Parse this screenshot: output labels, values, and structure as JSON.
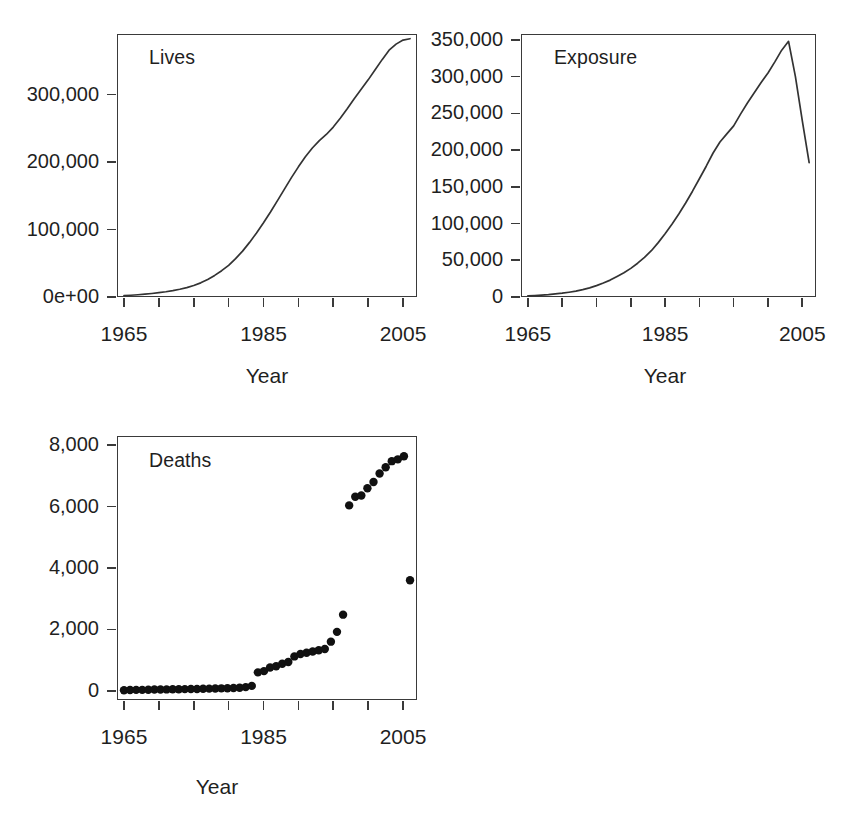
{
  "figure": {
    "background_color": "#ffffff",
    "line_color": "#333333",
    "point_color": "#111111",
    "axis_color": "#3a3a3a"
  },
  "panels": [
    {
      "id": "lives",
      "label": "Lives",
      "xlabel": "Year",
      "ylabel": "",
      "x_ticks": [
        1965,
        1970,
        1975,
        1980,
        1985,
        1990,
        1995,
        2000,
        2005
      ],
      "x_tick_labels": [
        "1965",
        "",
        "1985",
        "",
        "2005"
      ],
      "x_labeled_ticks": [
        1965,
        1985,
        2005
      ],
      "y_ticks": [
        0,
        100000,
        200000,
        300000
      ],
      "y_tick_labels": [
        "0e+00",
        "100,000",
        "200,000",
        "300,000"
      ],
      "xlim": [
        1964,
        2007
      ],
      "ylim": [
        0,
        390000
      ]
    },
    {
      "id": "exposure",
      "label": "Exposure",
      "xlabel": "Year",
      "ylabel": "",
      "x_ticks": [
        1965,
        1970,
        1975,
        1980,
        1985,
        1990,
        1995,
        2000,
        2005
      ],
      "x_tick_labels": [
        "1965",
        "",
        "1985",
        "",
        "2005"
      ],
      "x_labeled_ticks": [
        1965,
        1985,
        2005
      ],
      "y_ticks": [
        0,
        50000,
        100000,
        150000,
        200000,
        250000,
        300000,
        350000
      ],
      "y_tick_labels": [
        "0",
        "50,000",
        "100,000",
        "150,000",
        "200,000",
        "250,000",
        "300,000",
        "350,000"
      ],
      "xlim": [
        1964,
        2007
      ],
      "ylim": [
        0,
        358000
      ]
    },
    {
      "id": "deaths",
      "label": "Deaths",
      "xlabel": "Year",
      "ylabel": "",
      "x_ticks": [
        1965,
        1970,
        1975,
        1980,
        1985,
        1990,
        1995,
        2000,
        2005
      ],
      "x_tick_labels": [
        "1965",
        "",
        "1985",
        "",
        "2005"
      ],
      "x_labeled_ticks": [
        1965,
        1985,
        2005
      ],
      "y_ticks": [
        0,
        2000,
        4000,
        6000,
        8000
      ],
      "y_tick_labels": [
        "0",
        "2,000",
        "4,000",
        "6,000",
        "8,000"
      ],
      "xlim": [
        1964,
        2007
      ],
      "ylim": [
        -300,
        8300
      ]
    }
  ],
  "chart_data": [
    {
      "type": "line",
      "title": "Lives",
      "xlabel": "Year",
      "ylabel": "",
      "grid": false,
      "legend": "none",
      "xlim": [
        1964,
        2007
      ],
      "ylim": [
        0,
        390000
      ],
      "x": [
        1965,
        1966,
        1967,
        1968,
        1969,
        1970,
        1971,
        1972,
        1973,
        1974,
        1975,
        1976,
        1977,
        1978,
        1979,
        1980,
        1981,
        1982,
        1983,
        1984,
        1985,
        1986,
        1987,
        1988,
        1989,
        1990,
        1991,
        1992,
        1993,
        1994,
        1995,
        1996,
        1997,
        1998,
        1999,
        2000,
        2001,
        2002,
        2003,
        2004,
        2005,
        2006
      ],
      "values": [
        2000,
        2600,
        3300,
        4200,
        5200,
        6400,
        7800,
        9500,
        11500,
        14000,
        17000,
        21000,
        26000,
        32000,
        39000,
        47000,
        57000,
        68000,
        81000,
        95000,
        110000,
        126000,
        143000,
        160000,
        177000,
        193000,
        208000,
        221000,
        232000,
        241000,
        252000,
        265000,
        279000,
        294000,
        308000,
        322000,
        337000,
        352000,
        366000,
        375000,
        381000,
        383000
      ]
    },
    {
      "type": "line",
      "title": "Exposure",
      "xlabel": "Year",
      "ylabel": "",
      "grid": false,
      "legend": "none",
      "xlim": [
        1964,
        2007
      ],
      "ylim": [
        0,
        358000
      ],
      "x": [
        1965,
        1966,
        1967,
        1968,
        1969,
        1970,
        1971,
        1972,
        1973,
        1974,
        1975,
        1976,
        1977,
        1978,
        1979,
        1980,
        1981,
        1982,
        1983,
        1984,
        1985,
        1986,
        1987,
        1988,
        1989,
        1990,
        1991,
        1992,
        1993,
        1994,
        1995,
        1996,
        1997,
        1998,
        1999,
        2000,
        2001,
        2002,
        2003,
        2004,
        2005,
        2006
      ],
      "values": [
        1500,
        2000,
        2600,
        3300,
        4200,
        5200,
        6500,
        8000,
        10000,
        12500,
        15500,
        19000,
        23000,
        28000,
        33000,
        39000,
        46000,
        54000,
        63000,
        74000,
        86000,
        99000,
        113000,
        128000,
        144000,
        161000,
        178000,
        196000,
        211000,
        222000,
        233000,
        249000,
        264000,
        278000,
        292000,
        305000,
        320000,
        336000,
        348000,
        300000,
        240000,
        183000
      ]
    },
    {
      "type": "scatter",
      "title": "Deaths",
      "xlabel": "Year",
      "ylabel": "",
      "grid": false,
      "legend": "none",
      "xlim": [
        1964,
        2007
      ],
      "ylim": [
        -300,
        8300
      ],
      "x": [
        1965,
        1966,
        1967,
        1968,
        1969,
        1970,
        1971,
        1972,
        1973,
        1974,
        1975,
        1976,
        1977,
        1978,
        1979,
        1980,
        1981,
        1982,
        1983,
        1984,
        1985,
        1986,
        1987,
        1988,
        1989,
        1990,
        1991,
        1992,
        1993,
        1994,
        1995,
        1996,
        1997,
        1998,
        1999,
        2000,
        2001,
        2002,
        2003,
        2004,
        2005,
        2006
      ],
      "values": [
        20,
        25,
        30,
        30,
        35,
        40,
        40,
        45,
        50,
        50,
        55,
        60,
        60,
        65,
        70,
        75,
        80,
        85,
        90,
        100,
        120,
        160,
        600,
        640,
        760,
        800,
        880,
        940,
        1120,
        1200,
        1240,
        1280,
        1320,
        1360,
        1600,
        1920,
        2480,
        6040,
        6320,
        6360,
        6600,
        6800,
        7080,
        7280,
        7480,
        7540,
        7640,
        3600
      ]
    }
  ],
  "ghost_text": {
    "top_mark": "",
    "left_faint": ""
  }
}
